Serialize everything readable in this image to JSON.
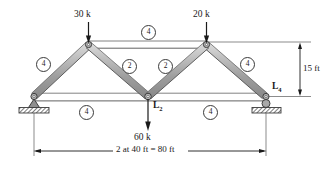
{
  "figure": {
    "type": "truss-free-body-diagram",
    "colors": {
      "member_fill": "#a9a9a9",
      "member_edge": "#4a4a4a",
      "member_highlight": "#cfcfcf",
      "line": "#1a1a1a",
      "background": "#ffffff",
      "support_hatch": "#6e6e6e"
    }
  },
  "loads": [
    {
      "id": "load-left-top",
      "label": "30 k",
      "magnitude": 30,
      "unit": "k",
      "direction": "down",
      "at_joint": "U1"
    },
    {
      "id": "load-right-top",
      "label": "20 k",
      "magnitude": 20,
      "unit": "k",
      "direction": "down",
      "at_joint": "U3"
    },
    {
      "id": "load-center-bottom",
      "label": "60 k",
      "magnitude": 60,
      "unit": "k",
      "direction": "down",
      "at_joint": "L2"
    }
  ],
  "joint_labels": [
    {
      "id": "joint-L2",
      "text": "L",
      "sub": "2"
    },
    {
      "id": "joint-L4",
      "text": "L",
      "sub": "4"
    }
  ],
  "members": [
    {
      "id": "member-left-diagonal",
      "number": "4",
      "position": "left-inclined-chord"
    },
    {
      "id": "member-top-chord",
      "number": "4",
      "position": "top-chord"
    },
    {
      "id": "member-right-diagonal",
      "number": "4",
      "position": "right-inclined-chord"
    },
    {
      "id": "member-left-web",
      "number": "2",
      "position": "left-inner-diagonal"
    },
    {
      "id": "member-right-web",
      "number": "2",
      "position": "right-inner-diagonal"
    },
    {
      "id": "member-bottom-left-chord",
      "number": "4",
      "position": "bottom-left-chord"
    },
    {
      "id": "member-bottom-right-chord",
      "number": "4",
      "position": "bottom-right-chord"
    }
  ],
  "dimensions": [
    {
      "id": "dim-height",
      "label": "15 ft",
      "value": 15,
      "unit": "ft",
      "orientation": "vertical"
    },
    {
      "id": "dim-span",
      "label": "2 at 40 ft = 80 ft",
      "value": 80,
      "unit": "ft",
      "orientation": "horizontal"
    }
  ],
  "supports": [
    {
      "id": "support-pin",
      "type": "pin",
      "side": "left"
    },
    {
      "id": "support-roller",
      "type": "roller",
      "side": "right"
    }
  ]
}
